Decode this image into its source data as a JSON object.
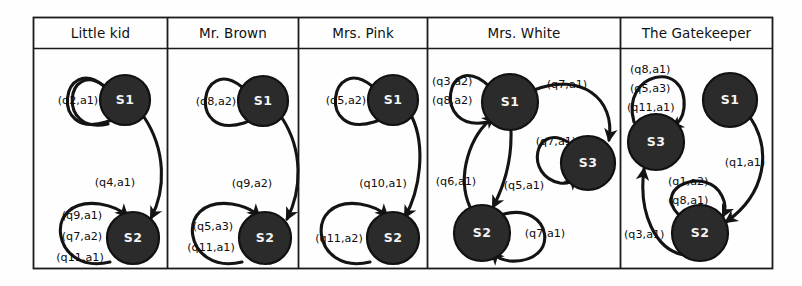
{
  "figure": {
    "panel_titles": [
      "Little kid",
      "Mr. Brown",
      "Mrs. Pink",
      "Mrs. White",
      "The Gatekeeper"
    ],
    "colors": {
      "state_fill": "#2b2b2b",
      "state_text": "#f4f4f4",
      "edge": "#141414",
      "frame": "#1b1b1b",
      "background": "#fefefe"
    }
  },
  "panels": [
    {
      "title": "Little kid",
      "states": [
        {
          "id": "S1",
          "label": "S1"
        },
        {
          "id": "S2",
          "label": "S2"
        }
      ],
      "self_loops": [
        {
          "state": "S1",
          "labels": [
            "(q2,a1)"
          ]
        },
        {
          "state": "S2",
          "labels": [
            "(q9,a1)",
            "(q7,a2)",
            "(q11,a1)"
          ]
        }
      ],
      "transitions": [
        {
          "from": "S1",
          "to": "S2",
          "label": "(q4,a1)"
        }
      ]
    },
    {
      "title": "Mr. Brown",
      "states": [
        {
          "id": "S1",
          "label": "S1"
        },
        {
          "id": "S2",
          "label": "S2"
        }
      ],
      "self_loops": [
        {
          "state": "S1",
          "labels": [
            "(q8,a2)"
          ]
        },
        {
          "state": "S2",
          "labels": [
            "(q5,a3)",
            "(q11,a1)"
          ]
        }
      ],
      "transitions": [
        {
          "from": "S1",
          "to": "S2",
          "label": "(q9,a2)"
        }
      ]
    },
    {
      "title": "Mrs. Pink",
      "states": [
        {
          "id": "S1",
          "label": "S1"
        },
        {
          "id": "S2",
          "label": "S2"
        }
      ],
      "self_loops": [
        {
          "state": "S1",
          "labels": [
            "(q5,a2)"
          ]
        },
        {
          "state": "S2",
          "labels": [
            "(q11,a2)"
          ]
        }
      ],
      "transitions": [
        {
          "from": "S1",
          "to": "S2",
          "label": "(q10,a1)"
        }
      ]
    },
    {
      "title": "Mrs. White",
      "states": [
        {
          "id": "S1",
          "label": "S1"
        },
        {
          "id": "S2",
          "label": "S2"
        },
        {
          "id": "S3",
          "label": "S3"
        }
      ],
      "self_loops": [
        {
          "state": "S1",
          "labels": [
            "(q3,a2)",
            "(q8,a2)"
          ]
        },
        {
          "state": "S3",
          "labels": [
            "(q7,a1)"
          ]
        },
        {
          "state": "S2",
          "labels": [
            "(q7,a1)"
          ]
        }
      ],
      "transitions": [
        {
          "from": "S1",
          "to": "S3",
          "label": "(q7,a1)"
        },
        {
          "from": "S1",
          "to": "S2",
          "label": "(q5,a1)"
        },
        {
          "from": "S2",
          "to": "S1",
          "label": "(q6,a1)"
        }
      ]
    },
    {
      "title": "The Gatekeeper",
      "states": [
        {
          "id": "S1",
          "label": "S1"
        },
        {
          "id": "S2",
          "label": "S2"
        },
        {
          "id": "S3",
          "label": "S3"
        }
      ],
      "self_loops": [
        {
          "state": "S3",
          "labels": [
            "(q8,a1)",
            "(q5,a3)",
            "(q11,a1)"
          ]
        },
        {
          "state": "S2",
          "labels": [
            "(q1,a2)",
            "(q8,a1)"
          ]
        }
      ],
      "transitions": [
        {
          "from": "S1",
          "to": "S2",
          "label": "(q1,a1)"
        },
        {
          "from": "S2",
          "to": "S3",
          "label": "(q3,a1)"
        }
      ]
    }
  ],
  "labels": {
    "p1_loop_s1": "(q2,a1)",
    "p1_loop_s2_1": "(q9,a1)",
    "p1_loop_s2_2": "(q7,a2)",
    "p1_loop_s2_3": "(q11,a1)",
    "p1_t1": "(q4,a1)",
    "p2_loop_s1": "(q8,a2)",
    "p2_loop_s2_1": "(q5,a3)",
    "p2_loop_s2_2": "(q11,a1)",
    "p2_t1": "(q9,a2)",
    "p3_loop_s1": "(q5,a2)",
    "p3_loop_s2": "(q11,a2)",
    "p3_t1": "(q10,a1)",
    "p4_loop_s1_1": "(q3,a2)",
    "p4_loop_s1_2": "(q8,a2)",
    "p4_t_s1_s3": "(q7,a1)",
    "p4_loop_s3": "(q7,a1)",
    "p4_t_s2_s1": "(q6,a1)",
    "p4_t_s1_s2": "(q5,a1)",
    "p4_loop_s2": "(q7,a1)",
    "p5_loop_s3_1": "(q8,a1)",
    "p5_loop_s3_2": "(q5,a3)",
    "p5_loop_s3_3": "(q11,a1)",
    "p5_t_s1_s2": "(q1,a1)",
    "p5_loop_s2_1": "(q1,a2)",
    "p5_loop_s2_2": "(q8,a1)",
    "p5_t_s2_s3": "(q3,a1)"
  },
  "state_labels": {
    "s1": "S1",
    "s2": "S2",
    "s3": "S3"
  }
}
